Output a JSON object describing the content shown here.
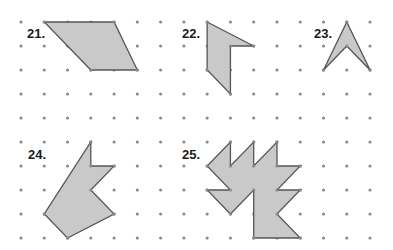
{
  "grid": {
    "origin_x": 21,
    "origin_y": 22,
    "spacing_x": 23.27,
    "spacing_y": 24.0,
    "cols": 16,
    "rows": 10,
    "dot_color": "#8a8a8a",
    "dot_radius": 1.6
  },
  "style": {
    "fill": "#c9c9c9",
    "stroke": "#555555",
    "stroke_width": 1.3
  },
  "figures": [
    {
      "label": "21.",
      "label_pos": [
        26,
        27
      ],
      "points": [
        [
          1,
          0
        ],
        [
          4,
          0
        ],
        [
          5,
          2
        ],
        [
          3,
          2
        ]
      ]
    },
    {
      "label": "22.",
      "label_pos": [
        181,
        27
      ],
      "points": [
        [
          8,
          0
        ],
        [
          10,
          1
        ],
        [
          9,
          1
        ],
        [
          9,
          3
        ],
        [
          8,
          2
        ]
      ]
    },
    {
      "label": "23.",
      "label_pos": [
        313,
        27
      ],
      "points": [
        [
          14,
          0
        ],
        [
          15,
          2
        ],
        [
          14,
          1
        ],
        [
          13,
          2
        ]
      ]
    },
    {
      "label": "24.",
      "label_pos": [
        27,
        148
      ],
      "points": [
        [
          3,
          5
        ],
        [
          3,
          6
        ],
        [
          4,
          6
        ],
        [
          3,
          7
        ],
        [
          4,
          8
        ],
        [
          2,
          9
        ],
        [
          1,
          8
        ]
      ]
    },
    {
      "label": "25.",
      "label_pos": [
        181,
        148
      ],
      "points": [
        [
          8,
          6
        ],
        [
          9,
          5
        ],
        [
          9,
          6
        ],
        [
          10,
          5
        ],
        [
          10,
          6
        ],
        [
          11,
          5
        ],
        [
          11,
          6
        ],
        [
          12,
          6
        ],
        [
          11,
          7
        ],
        [
          12,
          7
        ],
        [
          11,
          8
        ],
        [
          12,
          9
        ],
        [
          10,
          9
        ],
        [
          10,
          7
        ],
        [
          9,
          8
        ],
        [
          8,
          7
        ],
        [
          9,
          7
        ]
      ]
    }
  ]
}
